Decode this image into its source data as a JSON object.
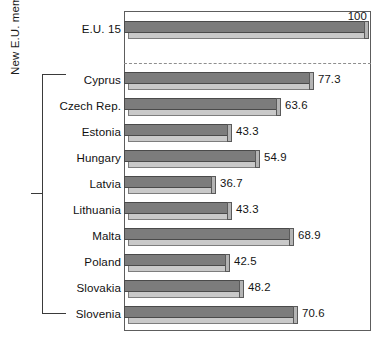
{
  "chart_data": {
    "type": "bar",
    "orientation": "horizontal",
    "title": "",
    "xlabel": "",
    "ylabel": "",
    "xlim": [
      0,
      104
    ],
    "grid": false,
    "legend": null,
    "categories": [
      "E.U. 15",
      "Cyprus",
      "Czech Rep.",
      "Estonia",
      "Hungary",
      "Latvia",
      "Lithuania",
      "Malta",
      "Poland",
      "Slovakia",
      "Slovenia"
    ],
    "values": [
      100,
      77.3,
      63.6,
      43.3,
      54.9,
      36.7,
      43.3,
      68.9,
      42.5,
      48.2,
      70.6
    ],
    "value_labels": [
      "100",
      "77.3",
      "63.6",
      "43.3",
      "54.9",
      "36.7",
      "43.3",
      "68.9",
      "42.5",
      "48.2",
      "70.6"
    ],
    "annotations": [
      {
        "name": "group-bracket-label",
        "text": "New E.U. members, 2004",
        "covers": [
          "Cyprus",
          "Czech Rep.",
          "Estonia",
          "Hungary",
          "Latvia",
          "Lithuania",
          "Malta",
          "Poland",
          "Slovakia",
          "Slovenia"
        ]
      },
      {
        "name": "reference-divider",
        "text": "",
        "style": "dashed",
        "between": [
          "E.U. 15",
          "Cyprus"
        ]
      }
    ],
    "colors": {
      "bar_top_face": "#7c7c7c",
      "bar_front_face": "#c9c9c9",
      "bar_cap_face": "#b4b4b4",
      "bar_outline": "#4a4a4a",
      "frame": "#5d5d5d",
      "divider": "#8e8e8e",
      "text": "#111111",
      "background": "#ffffff"
    }
  },
  "group_axis": {
    "title": "New E.U. members, 2004"
  },
  "rows": [
    {
      "label": "E.U. 15",
      "value": 100,
      "value_label": "100",
      "group": "eu15"
    },
    {
      "label": "Cyprus",
      "value": 77.3,
      "value_label": "77.3",
      "group": "new"
    },
    {
      "label": "Czech Rep.",
      "value": 63.6,
      "value_label": "63.6",
      "group": "new"
    },
    {
      "label": "Estonia",
      "value": 43.3,
      "value_label": "43.3",
      "group": "new"
    },
    {
      "label": "Hungary",
      "value": 54.9,
      "value_label": "54.9",
      "group": "new"
    },
    {
      "label": "Latvia",
      "value": 36.7,
      "value_label": "36.7",
      "group": "new"
    },
    {
      "label": "Lithuania",
      "value": 43.3,
      "value_label": "43.3",
      "group": "new"
    },
    {
      "label": "Malta",
      "value": 68.9,
      "value_label": "68.9",
      "group": "new"
    },
    {
      "label": "Poland",
      "value": 42.5,
      "value_label": "42.5",
      "group": "new"
    },
    {
      "label": "Slovakia",
      "value": 48.2,
      "value_label": "48.2",
      "group": "new"
    },
    {
      "label": "Slovenia",
      "value": 70.6,
      "value_label": "70.6",
      "group": "new"
    }
  ]
}
